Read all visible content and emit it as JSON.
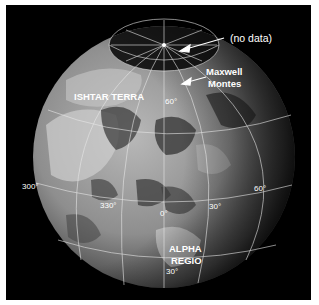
{
  "figure": {
    "background_color": "#000000",
    "border_color": "#ffffff"
  },
  "annotations": {
    "no_data": "(no data)",
    "maxwell_line1": "Maxwell",
    "maxwell_line2": "Montes",
    "ishtar": "ISHTAR TERRA",
    "alpha_line1": "ALPHA",
    "alpha_line2": "REGIO"
  },
  "graticule_labels": {
    "lat_60n": "60°",
    "lon_300": "300°",
    "lon_330": "330°",
    "lon_0": "0°",
    "lon_30": "30°",
    "lon_60": "60°",
    "lat_30s": "30°"
  }
}
